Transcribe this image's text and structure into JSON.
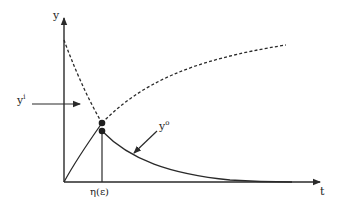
{
  "diagram": {
    "axes": {
      "y_label": "y",
      "x_label": "t"
    },
    "labels": {
      "input": {
        "base": "y",
        "sup": "i"
      },
      "output": {
        "base": "y",
        "sup": "o"
      },
      "switch_time": "η(ε)"
    },
    "curves": [
      {
        "name": "dashed-decreasing-curve",
        "style": "dashed",
        "description": "decreasing from top of y-axis to switch point"
      },
      {
        "name": "dashed-increasing-curve",
        "style": "dashed",
        "description": "increasing from switch point toward saturation"
      },
      {
        "name": "solid-rising-curve",
        "style": "solid",
        "description": "rises from origin to switch point"
      },
      {
        "name": "solid-decaying-curve",
        "style": "solid",
        "description": "decays from switch point to zero"
      }
    ],
    "markers": [
      {
        "name": "upper-switch-dot"
      },
      {
        "name": "lower-switch-dot"
      }
    ],
    "colors": {
      "line": "#2a2a2a",
      "background": "#ffffff"
    }
  }
}
